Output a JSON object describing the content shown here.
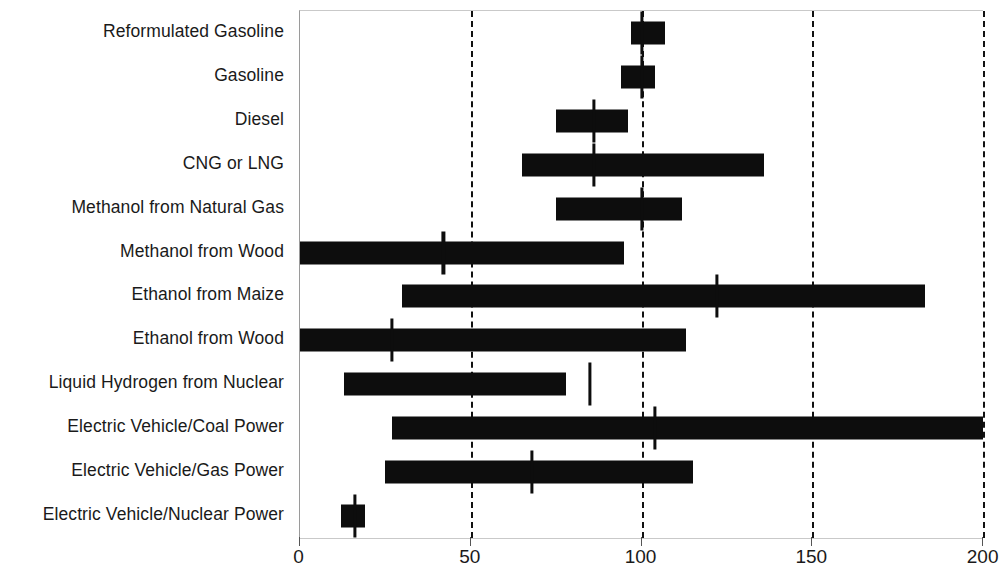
{
  "chart_data": {
    "type": "bar",
    "subtype": "range-bar-with-marker",
    "title": "",
    "subtitle": "",
    "xlabel": "",
    "ylabel": "",
    "xlim": [
      0,
      200
    ],
    "ylim": null,
    "grid": true,
    "grid_axis": "x",
    "grid_style": "dashed",
    "legend": null,
    "legend_position": "none",
    "xticks": [
      0,
      50,
      100,
      150,
      200
    ],
    "xtick_labels": [
      "0",
      "50",
      "100",
      "150",
      "200"
    ],
    "categories": [
      "Reformulated Gasoline",
      "Gasoline",
      "Diesel",
      "CNG or LNG",
      "Methanol from Natural Gas",
      "Methanol from Wood",
      "Ethanol from Maize",
      "Ethanol from Wood",
      "Liquid Hydrogen from Nuclear",
      "Electric Vehicle/Coal  Power",
      "Electric Vehicle/Gas Power",
      "Electric Vehicle/Nuclear Power"
    ],
    "series": [
      {
        "name": "range",
        "low": [
          97,
          94,
          75,
          65,
          75,
          0,
          30,
          0,
          13,
          27,
          25,
          12
        ],
        "high": [
          107,
          104,
          96,
          136,
          112,
          95,
          183,
          113,
          78,
          200,
          115,
          19
        ]
      },
      {
        "name": "central value",
        "values": [
          100,
          100,
          86,
          86,
          100,
          42,
          122,
          27,
          85,
          104,
          68,
          16
        ]
      }
    ],
    "colors": {
      "bar": "#0d0d0d",
      "marker": "#0d0d0d",
      "grid": "#111111",
      "axis": "#9a9a9a",
      "text": "#1a1a1a",
      "background": "#ffffff"
    }
  },
  "axis": {
    "x_tick_labels": [
      "0",
      "50",
      "100",
      "150",
      "200"
    ]
  }
}
